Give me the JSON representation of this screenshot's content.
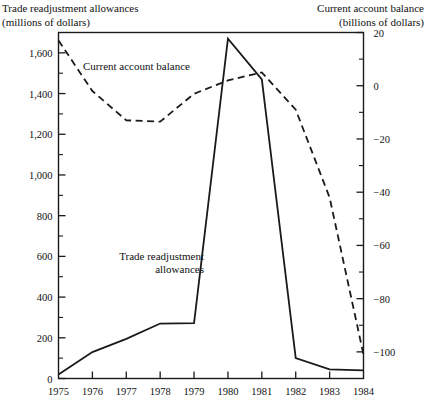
{
  "header": {
    "left_title": "Trade readjustment allowances",
    "left_units": "(millions of dollars)",
    "right_title": "Current account balance",
    "right_units": "(billions of dollars)"
  },
  "annotations": {
    "current_account_label": "Current account balance",
    "trade_allowances_label_line1": "Trade readjustment",
    "trade_allowances_label_line2": "allowances"
  },
  "chart_data": {
    "type": "line",
    "title": "",
    "subtitle": "",
    "xlabel": "",
    "ylabel": "Trade readjustment allowances (millions of dollars)",
    "y2label": "Current account balance (billions of dollars)",
    "grid": false,
    "legend_position": "inline-annotations",
    "categories": [
      "1975",
      "1976",
      "1977",
      "1978",
      "1979",
      "1980",
      "1981",
      "1982",
      "1983",
      "1984"
    ],
    "x": [
      1975,
      1976,
      1977,
      1978,
      1979,
      1980,
      1981,
      1982,
      1983,
      1984
    ],
    "ylim": [
      0,
      1700
    ],
    "y2lim": [
      -110,
      20
    ],
    "yticks": [
      0,
      200,
      400,
      600,
      800,
      1000,
      1200,
      1400,
      1600
    ],
    "ytick_labels": [
      "0",
      "200",
      "400",
      "600",
      "800",
      "1,000",
      "1,200",
      "1,400",
      "1,600"
    ],
    "yminorticks": [
      100,
      300,
      500,
      700,
      900,
      1100,
      1300,
      1500
    ],
    "y2ticks": [
      20,
      0,
      -20,
      -40,
      -60,
      -80,
      -100
    ],
    "y2tick_labels": [
      "20",
      "0",
      "−20",
      "−40",
      "−60",
      "−80",
      "−100"
    ],
    "y2minorticks": [
      10,
      -10,
      -30,
      -50,
      -70,
      -90
    ],
    "series": [
      {
        "name": "Trade readjustment allowances",
        "axis": "left",
        "style": "solid",
        "color": "#1a1a1a",
        "values": [
          20,
          130,
          195,
          270,
          272,
          1670,
          1470,
          100,
          45,
          40
        ]
      },
      {
        "name": "Current account balance",
        "axis": "right",
        "style": "dashed",
        "color": "#1a1a1a",
        "values": [
          17,
          -2,
          -13,
          -13.5,
          -3,
          2,
          5,
          -9,
          -42,
          -101
        ]
      }
    ]
  }
}
